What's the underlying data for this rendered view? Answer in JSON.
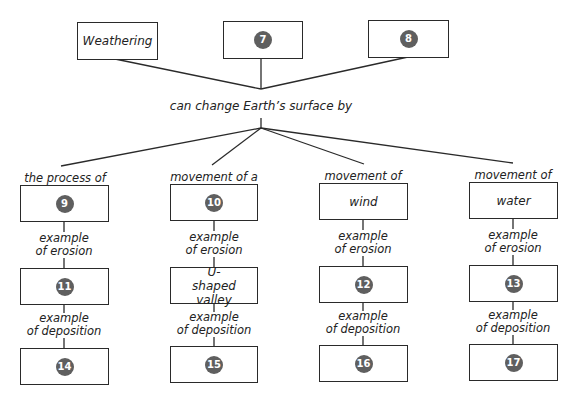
{
  "top_boxes": [
    {
      "text": "Weathering"
    },
    {
      "badge": "7"
    },
    {
      "badge": "8"
    }
  ],
  "center_label": "can change Earth’s surface by",
  "columns": [
    {
      "header": "the process of",
      "box1": {
        "badge": "9"
      },
      "erosion_label": [
        "example",
        "of erosion"
      ],
      "box2": {
        "badge": "11"
      },
      "deposition_label": [
        "example",
        "of deposition"
      ],
      "box3": {
        "badge": "14"
      }
    },
    {
      "header": "movement of a",
      "box1": {
        "badge": "10"
      },
      "erosion_label": [
        "example",
        "of erosion"
      ],
      "box2": {
        "text": "U-shaped valley"
      },
      "deposition_label": [
        "example",
        "of deposition"
      ],
      "box3": {
        "badge": "15"
      }
    },
    {
      "header": "movement of",
      "box1": {
        "text": "wind"
      },
      "erosion_label": [
        "example",
        "of erosion"
      ],
      "box2": {
        "badge": "12"
      },
      "deposition_label": [
        "example",
        "of deposition"
      ],
      "box3": {
        "badge": "16"
      }
    },
    {
      "header": "movement of",
      "box1": {
        "text": "water"
      },
      "erosion_label": [
        "example",
        "of erosion"
      ],
      "box2": {
        "badge": "13"
      },
      "deposition_label": [
        "example",
        "of deposition"
      ],
      "box3": {
        "badge": "17"
      }
    }
  ],
  "colors": {
    "badge": "#5f5f5f",
    "line": "#2a2a2a"
  }
}
